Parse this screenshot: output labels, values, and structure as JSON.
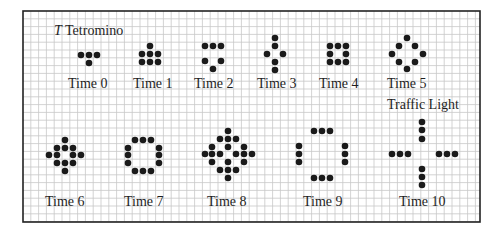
{
  "figure": {
    "frame": {
      "x": 23,
      "y": 11,
      "width": 457,
      "height": 211
    },
    "grid": {
      "spacing": 7.8,
      "line_color": "#c8c8c8",
      "border_color": "#222222"
    },
    "dot": {
      "radius": 3.3,
      "color": "#1a1a1a"
    },
    "title": {
      "italic_part": "T",
      "text": "Tetromino",
      "x": 54,
      "y": 24
    },
    "section_label": {
      "text": "Traffic Light",
      "x": 387,
      "y": 98
    },
    "panels": [
      {
        "label": "Time 0",
        "label_x": 68,
        "label_y": 77,
        "dots": [
          [
            81,
            55
          ],
          [
            89,
            55
          ],
          [
            97,
            55
          ],
          [
            89,
            63
          ]
        ]
      },
      {
        "label": "Time 1",
        "label_x": 133,
        "label_y": 77,
        "dots": [
          [
            150,
            46
          ],
          [
            142,
            54
          ],
          [
            150,
            54
          ],
          [
            158,
            54
          ],
          [
            142,
            62
          ],
          [
            150,
            62
          ],
          [
            158,
            62
          ]
        ]
      },
      {
        "label": "Time 2",
        "label_x": 194,
        "label_y": 77,
        "dots": [
          [
            205,
            46
          ],
          [
            213,
            46
          ],
          [
            221,
            46
          ],
          [
            205,
            61
          ],
          [
            221,
            61
          ],
          [
            213,
            69
          ]
        ]
      },
      {
        "label": "Time 3",
        "label_x": 257,
        "label_y": 77,
        "dots": [
          [
            275,
            38
          ],
          [
            275,
            46
          ],
          [
            267,
            54
          ],
          [
            283,
            54
          ],
          [
            275,
            62
          ],
          [
            275,
            70
          ]
        ]
      },
      {
        "label": "Time 4",
        "label_x": 319,
        "label_y": 77,
        "dots": [
          [
            330,
            46
          ],
          [
            338,
            46
          ],
          [
            346,
            46
          ],
          [
            330,
            54
          ],
          [
            346,
            54
          ],
          [
            330,
            62
          ],
          [
            338,
            62
          ],
          [
            346,
            62
          ]
        ]
      },
      {
        "label": "Time 5",
        "label_x": 387,
        "label_y": 77,
        "dots": [
          [
            407,
            38
          ],
          [
            399,
            46
          ],
          [
            415,
            46
          ],
          [
            392,
            54
          ],
          [
            423,
            54
          ],
          [
            399,
            62
          ],
          [
            415,
            62
          ],
          [
            407,
            69
          ]
        ]
      },
      {
        "label": "Time 6",
        "label_x": 45,
        "label_y": 195,
        "dots": [
          [
            65,
            140
          ],
          [
            57,
            148
          ],
          [
            65,
            148
          ],
          [
            73,
            148
          ],
          [
            49,
            155
          ],
          [
            57,
            155
          ],
          [
            73,
            155
          ],
          [
            81,
            155
          ],
          [
            57,
            163
          ],
          [
            65,
            163
          ],
          [
            73,
            163
          ],
          [
            65,
            171
          ]
        ]
      },
      {
        "label": "Time 7",
        "label_x": 124,
        "label_y": 195,
        "dots": [
          [
            135,
            140
          ],
          [
            143,
            140
          ],
          [
            151,
            140
          ],
          [
            128,
            148
          ],
          [
            128,
            155
          ],
          [
            128,
            163
          ],
          [
            159,
            148
          ],
          [
            159,
            155
          ],
          [
            159,
            163
          ],
          [
            135,
            171
          ],
          [
            143,
            171
          ],
          [
            151,
            171
          ]
        ]
      },
      {
        "label": "Time 8",
        "label_x": 207,
        "label_y": 195,
        "dots": [
          [
            228,
            131
          ],
          [
            220,
            139
          ],
          [
            228,
            139
          ],
          [
            236,
            139
          ],
          [
            212,
            147
          ],
          [
            228,
            147
          ],
          [
            244,
            147
          ],
          [
            205,
            154
          ],
          [
            212,
            154
          ],
          [
            220,
            154
          ],
          [
            236,
            154
          ],
          [
            244,
            154
          ],
          [
            252,
            154
          ],
          [
            212,
            162
          ],
          [
            228,
            162
          ],
          [
            244,
            162
          ],
          [
            220,
            170
          ],
          [
            228,
            170
          ],
          [
            236,
            170
          ],
          [
            228,
            178
          ]
        ]
      },
      {
        "label": "Time 9",
        "label_x": 303,
        "label_y": 195,
        "dots": [
          [
            314,
            131
          ],
          [
            322,
            131
          ],
          [
            330,
            131
          ],
          [
            299,
            146
          ],
          [
            299,
            154
          ],
          [
            299,
            162
          ],
          [
            345,
            146
          ],
          [
            345,
            154
          ],
          [
            345,
            162
          ],
          [
            314,
            178
          ],
          [
            322,
            178
          ],
          [
            330,
            178
          ]
        ]
      },
      {
        "label": "Time 10",
        "label_x": 399,
        "label_y": 195,
        "dots": [
          [
            422,
            122
          ],
          [
            422,
            130
          ],
          [
            422,
            139
          ],
          [
            392,
            154
          ],
          [
            400,
            154
          ],
          [
            408,
            154
          ],
          [
            439,
            154
          ],
          [
            447,
            154
          ],
          [
            455,
            154
          ],
          [
            422,
            169
          ],
          [
            422,
            177
          ],
          [
            422,
            185
          ]
        ]
      }
    ]
  }
}
